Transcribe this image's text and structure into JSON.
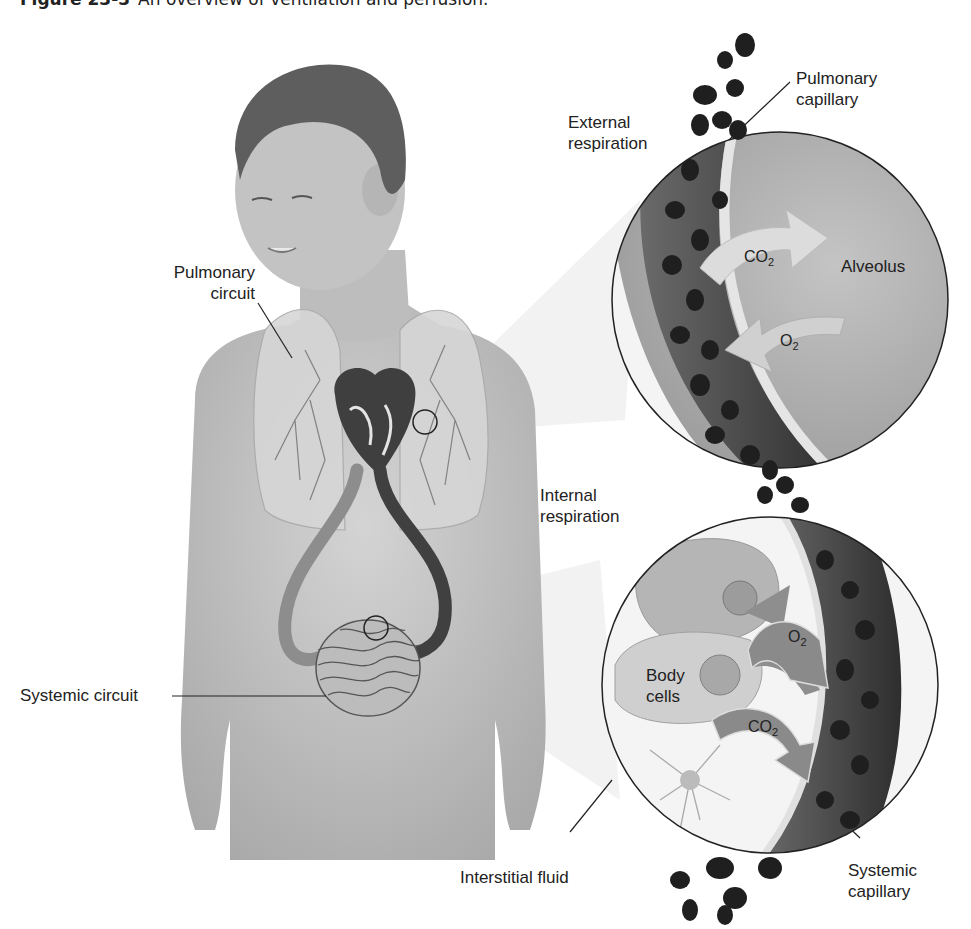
{
  "figure": {
    "number": "Figure 23-3",
    "title": "An overview of ventilation and perfusion."
  },
  "labels": {
    "pulmonary_circuit": [
      "Pulmonary",
      "circuit"
    ],
    "systemic_circuit": "Systemic circuit",
    "external_respiration": [
      "External",
      "respiration"
    ],
    "internal_respiration": [
      "Internal",
      "respiration"
    ],
    "pulmonary_capillary": [
      "Pulmonary",
      "capillary"
    ],
    "alveolus": "Alveolus",
    "body_cells": [
      "Body",
      "cells"
    ],
    "interstitial_fluid": "Interstitial fluid",
    "systemic_capillary": [
      "Systemic",
      "capillary"
    ]
  },
  "gases": {
    "co2_base": "CO",
    "co2_sub": "2",
    "o2_base": "O",
    "o2_sub": "2"
  },
  "colors": {
    "background": "#ffffff",
    "skin": "#c9c9c9",
    "hair": "#5e5e5e",
    "blood_dark": "#3a3a3a",
    "alveolus": "#b8b8b8",
    "arrow_light": "#d9d9d9",
    "arrow_dark": "#8a8a8a",
    "text": "#222222"
  }
}
